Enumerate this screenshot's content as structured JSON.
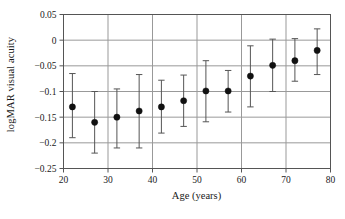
{
  "chart_data": {
    "type": "scatter",
    "title": "",
    "xlabel": "Age (years)",
    "ylabel": "logMAR visual acuity",
    "xlim": [
      20,
      80
    ],
    "ylim": [
      -0.25,
      0.05
    ],
    "xticks": [
      "20",
      "30",
      "40",
      "50",
      "60",
      "70",
      "80"
    ],
    "xtick_values": [
      20,
      30,
      40,
      50,
      60,
      70,
      80
    ],
    "yticks": [
      "0.05",
      "0",
      "−0.05",
      "−0.1",
      "−0.15",
      "−0.2",
      "−0.25"
    ],
    "ytick_values": [
      0.05,
      0,
      -0.05,
      -0.1,
      -0.15,
      -0.2,
      -0.25
    ],
    "grid": "both",
    "legend": "none",
    "marker": "filled-circle",
    "error_bars": "vertical",
    "x": [
      22,
      27,
      32,
      37,
      42,
      47,
      52,
      57,
      62,
      67,
      72,
      77
    ],
    "values": [
      -0.13,
      -0.16,
      -0.15,
      -0.138,
      -0.13,
      -0.118,
      -0.099,
      -0.099,
      -0.07,
      -0.049,
      -0.04,
      -0.02
    ],
    "err_low": [
      -0.19,
      -0.22,
      -0.21,
      -0.21,
      -0.181,
      -0.168,
      -0.159,
      -0.14,
      -0.13,
      -0.1,
      -0.08,
      -0.067
    ],
    "err_high": [
      -0.065,
      -0.1,
      -0.095,
      -0.067,
      -0.078,
      -0.068,
      -0.04,
      -0.059,
      -0.011,
      0.002,
      0.003,
      0.022
    ],
    "colors": {
      "marker": "#111111",
      "error_bar": "#555555",
      "grid": "#999999",
      "axis": "#555555",
      "text": "#1a1a1a",
      "background": "#ffffff"
    }
  }
}
